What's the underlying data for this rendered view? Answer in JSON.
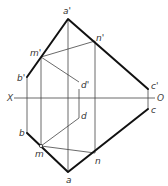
{
  "diagram": {
    "type": "orthographic projection (descriptive geometry)",
    "axis": {
      "left_label": "X",
      "right_label": "O"
    },
    "front_view_labels": {
      "a": "a'",
      "b": "b'",
      "c": "c'",
      "d": "d'",
      "m": "m'",
      "n": "n'"
    },
    "top_view_labels": {
      "a": "a",
      "b": "b",
      "c": "c",
      "d": "d",
      "m": "m",
      "n": "n"
    },
    "caption": ""
  }
}
